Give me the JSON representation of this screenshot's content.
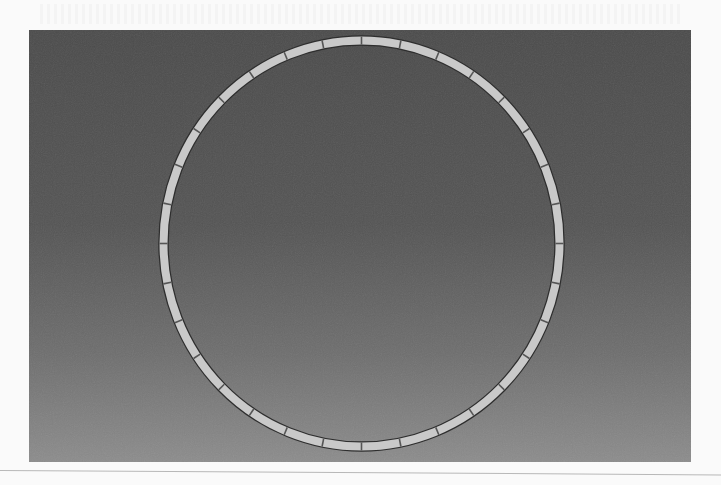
{
  "figure": {
    "background": {
      "top_color": "#4b4b4b",
      "bottom_color": "#8c8c8c"
    },
    "ring": {
      "segment_count": 32,
      "fill_color": "#c9c9c9",
      "outline_color": "#2e2e2e",
      "divider_color": "#555555",
      "center": [
        332.5,
        213.5
      ],
      "radius_x": 198,
      "radius_y": 203,
      "thickness": 8
    }
  }
}
